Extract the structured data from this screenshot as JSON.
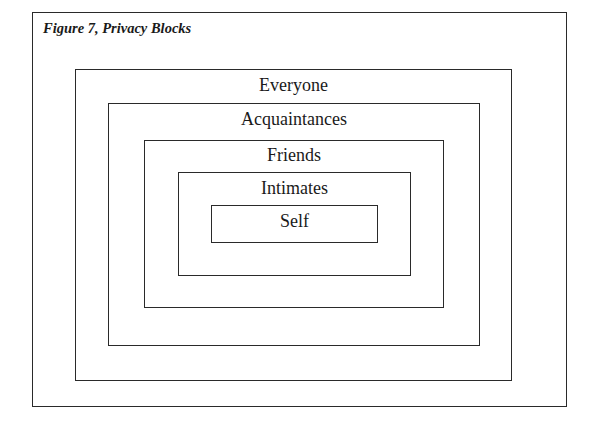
{
  "figure": {
    "title": "Figure 7, Privacy Blocks",
    "levels": [
      {
        "label": "Everyone"
      },
      {
        "label": "Acquaintances"
      },
      {
        "label": "Friends"
      },
      {
        "label": "Intimates"
      },
      {
        "label": "Self"
      }
    ]
  }
}
